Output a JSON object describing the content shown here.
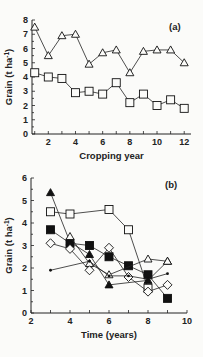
{
  "chart_data": [
    {
      "type": "line",
      "panel_label": "(a)",
      "title": "",
      "xlabel": "Cropping year",
      "ylabel": "Grain (t ha-1)",
      "xlim": [
        0.8,
        12.5
      ],
      "ylim": [
        0,
        8
      ],
      "xticks": [
        2,
        4,
        6,
        8,
        10,
        12
      ],
      "yticks": [
        0,
        1,
        2,
        3,
        4,
        5,
        6,
        7,
        8
      ],
      "grid": false,
      "legend": null,
      "x": [
        1,
        2,
        3,
        4,
        5,
        6,
        7,
        8,
        9,
        10,
        11,
        12
      ],
      "series": [
        {
          "name": "open-triangle",
          "marker": "triangle-open",
          "values": [
            7.5,
            5.5,
            6.9,
            7.0,
            4.9,
            5.7,
            5.9,
            4.3,
            5.8,
            5.9,
            5.9,
            5.0
          ]
        },
        {
          "name": "open-square",
          "marker": "square-open",
          "values": [
            4.3,
            4.0,
            3.9,
            2.9,
            3.0,
            2.8,
            3.6,
            2.2,
            2.8,
            2.0,
            2.4,
            1.8
          ]
        }
      ]
    },
    {
      "type": "line",
      "panel_label": "(b)",
      "title": "",
      "xlabel": "Time (years)",
      "ylabel": "Grain (t ha-1)",
      "xlim": [
        2,
        10
      ],
      "ylim": [
        0,
        6
      ],
      "xticks": [
        2,
        4,
        6,
        8,
        10
      ],
      "yticks": [
        0,
        1,
        2,
        3,
        4,
        5,
        6
      ],
      "grid": false,
      "legend": null,
      "series": [
        {
          "name": "open-square",
          "marker": "square-open",
          "points": [
            [
              3,
              4.5
            ],
            [
              4,
              4.4
            ],
            [
              6,
              4.6
            ],
            [
              7,
              3.7
            ],
            [
              8,
              1.1
            ]
          ]
        },
        {
          "name": "filled-square",
          "marker": "square-filled",
          "points": [
            [
              3,
              3.7
            ],
            [
              4,
              3.1
            ],
            [
              5,
              3.0
            ],
            [
              6,
              2.5
            ],
            [
              7,
              2.1
            ],
            [
              8,
              1.7
            ],
            [
              9,
              0.65
            ]
          ]
        },
        {
          "name": "filled-triangle",
          "marker": "triangle-filled",
          "points": [
            [
              3,
              5.35
            ],
            [
              4,
              3.15
            ],
            [
              5,
              2.6
            ],
            [
              6,
              1.25
            ],
            [
              8,
              1.45
            ],
            [
              9,
              2.3
            ]
          ]
        },
        {
          "name": "open-triangle",
          "marker": "triangle-open",
          "points": [
            [
              4,
              3.4
            ],
            [
              5,
              2.2
            ],
            [
              6,
              1.7
            ],
            [
              8,
              2.4
            ],
            [
              9,
              2.3
            ]
          ]
        },
        {
          "name": "open-diamond",
          "marker": "diamond-open",
          "points": [
            [
              3,
              3.1
            ],
            [
              4,
              2.85
            ],
            [
              5,
              1.9
            ],
            [
              6,
              2.9
            ],
            [
              7,
              1.6
            ],
            [
              8,
              0.95
            ],
            [
              9,
              1.25
            ]
          ]
        },
        {
          "name": "small-dot",
          "marker": "dot",
          "points": [
            [
              3,
              1.9
            ],
            [
              5,
              2.3
            ],
            [
              6,
              1.65
            ],
            [
              7,
              1.65
            ],
            [
              8,
              1.5
            ],
            [
              9,
              1.75
            ]
          ]
        }
      ]
    }
  ]
}
